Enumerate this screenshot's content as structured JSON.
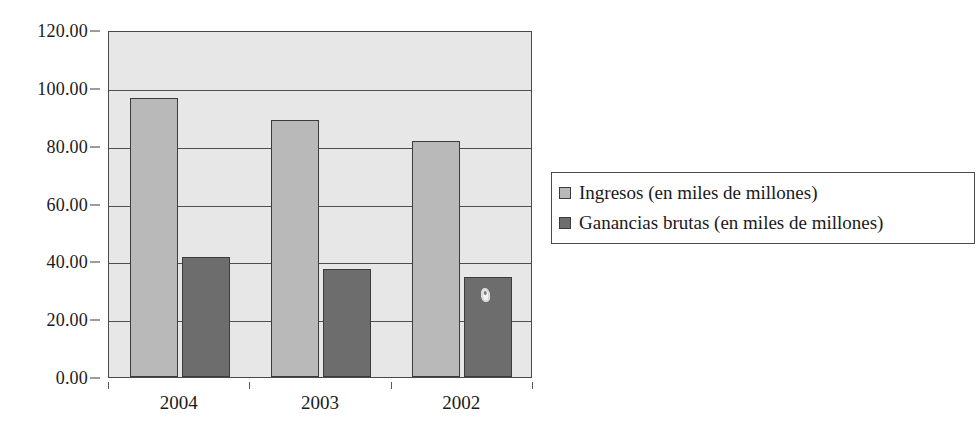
{
  "chart_data": {
    "type": "bar",
    "title": "",
    "xlabel": "",
    "ylabel": "",
    "categories": [
      "2004",
      "2003",
      "2002"
    ],
    "series": [
      {
        "name": "Ingresos (en miles de millones)",
        "color": "#b9b9b9",
        "values": [
          96.5,
          89.0,
          81.5
        ]
      },
      {
        "name": "Ganancias brutas (en miles de millones)",
        "color": "#6d6d6d",
        "values": [
          41.5,
          37.5,
          34.5
        ]
      }
    ],
    "ylim": [
      0,
      120
    ],
    "ytick_values": [
      0,
      20,
      40,
      60,
      80,
      100,
      120
    ],
    "ytick_labels": [
      "0.00",
      "20.00",
      "40.00",
      "60.00",
      "80.00",
      "100.00",
      "120.00"
    ],
    "grid": true,
    "legend_position": "right",
    "plot_background": "#e7e7e7",
    "axis_color": "#4a4a4a"
  },
  "annotations": {
    "scan_artifact_name": "scan-artifact-blob"
  }
}
